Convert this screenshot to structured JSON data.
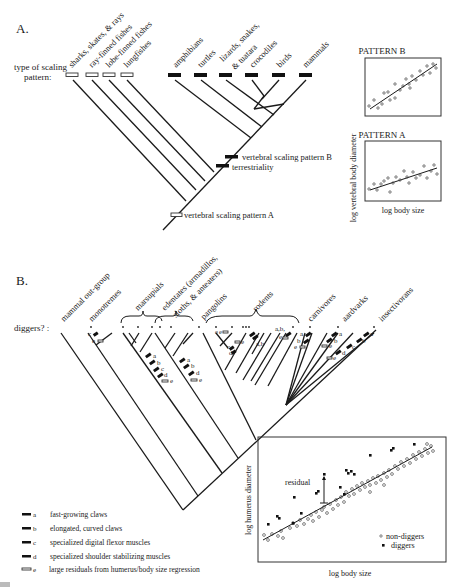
{
  "panel_a": {
    "label": "A.",
    "row_label_line1": "type of scaling",
    "row_label_line2": "pattern:",
    "taxa": [
      {
        "name": "sharks, skates, & rays",
        "pattern": "A"
      },
      {
        "name": "ray-finned fishes",
        "pattern": "A"
      },
      {
        "name": "lobe-finned fishes",
        "pattern": "A"
      },
      {
        "name": "lungfishes",
        "pattern": "A"
      },
      {
        "name": "amphibians",
        "pattern": "B"
      },
      {
        "name": "turtles",
        "pattern": "B"
      },
      {
        "name": "lizards, snakes,",
        "name2": "& tuatara",
        "pattern": "B"
      },
      {
        "name": "crocodiles",
        "pattern": "B"
      },
      {
        "name": "birds",
        "pattern": "B"
      },
      {
        "name": "mammals",
        "pattern": "B"
      }
    ],
    "events": {
      "pattern_b": "vertebral scaling pattern B",
      "terrestriality": "terrestriality",
      "pattern_a": "vertebral scaling pattern A"
    },
    "insets": {
      "pattern_b_title": "PATTERN B",
      "pattern_a_title": "PATTERN A",
      "ylabel": "log vertebral body diameter",
      "xlabel": "log body size"
    }
  },
  "panel_b": {
    "label": "B.",
    "row_label": "diggers? :",
    "taxa": [
      "mammal out-group",
      "monotremes",
      "marsupials",
      "edentates (armadillos,",
      "sloths, & anteaters)",
      "pangolins",
      "rodents",
      "carnivores",
      "aardvarks",
      "insectivorans"
    ],
    "legend": [
      {
        "key": "a",
        "text": "fast-growing claws",
        "style": "solid"
      },
      {
        "key": "b",
        "text": "elongated, curved claws",
        "style": "solid"
      },
      {
        "key": "c",
        "text": "specialized digital flexor muscles",
        "style": "solid"
      },
      {
        "key": "d",
        "text": "specialized shoulder stabilizing muscles",
        "style": "solid"
      },
      {
        "key": "e",
        "text": "large residuals from humerus/body size regression",
        "style": "hollow"
      }
    ],
    "scatter": {
      "ylabel": "log humerus diameter",
      "xlabel": "log body size",
      "annotation": "residual",
      "legend_nondiggers": "non-diggers",
      "legend_diggers": "diggers"
    },
    "marks": {
      "a": "a",
      "b": "b",
      "c": "c",
      "d": "d",
      "e": "e",
      "ab": "a,b",
      "ab2": "a,b,"
    }
  },
  "caption_fragment": "Figure 4"
}
